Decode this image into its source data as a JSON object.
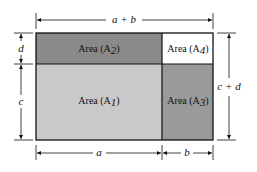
{
  "diagram": {
    "regions": [
      {
        "id": "A2",
        "label": "Area (A",
        "sub": "2",
        "color": "#8a8a8a"
      },
      {
        "id": "A4",
        "label": "Area (A",
        "sub": "4",
        "color": "#ffffff"
      },
      {
        "id": "A1",
        "label": "Area (A",
        "sub": "1",
        "color": "#c9c9c9"
      },
      {
        "id": "A3",
        "label": "Area (A",
        "sub": "3",
        "color": "#9a9a9a"
      }
    ],
    "dimensions": {
      "top": "a + b",
      "bottom_left": "a",
      "bottom_right": "b",
      "left_top": "d",
      "left_bottom": "c",
      "right": "c + d"
    },
    "stroke_color": "#111111"
  }
}
